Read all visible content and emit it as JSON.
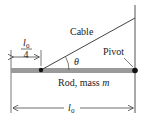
{
  "diagram": {
    "cable_label": "Cable",
    "pivot_label": "Pivot",
    "theta_label": "θ",
    "rod_label_prefix": "Rod, mass ",
    "rod_label_var": "m",
    "quarter_length": {
      "var": "l",
      "sub": "0",
      "denominator": "4"
    },
    "full_length": {
      "var": "l",
      "sub": "0"
    }
  },
  "colors": {
    "rod": "#9a9a9a",
    "line": "#333333",
    "dot": "#111111"
  }
}
